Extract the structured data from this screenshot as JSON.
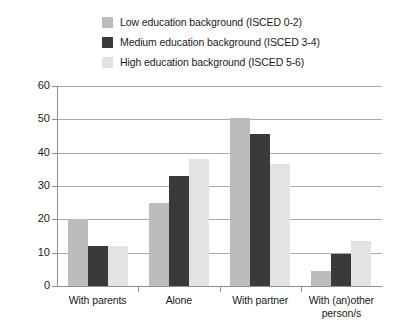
{
  "chart_data": {
    "type": "bar",
    "title": "",
    "xlabel": "",
    "ylabel": "",
    "ylim": [
      0,
      60
    ],
    "ytick_step": 10,
    "grid": true,
    "legend_position": "top",
    "categories": [
      "With parents",
      "Alone",
      "With partner",
      "With (an)other person/s"
    ],
    "category_lines": [
      [
        "With parents"
      ],
      [
        "Alone"
      ],
      [
        "With partner"
      ],
      [
        "With (an)other",
        "person/s"
      ]
    ],
    "yticks": [
      "0",
      "10",
      "20",
      "30",
      "40",
      "50",
      "60"
    ],
    "series": [
      {
        "name": "Low education background (ISCED 0-2)",
        "color": "#bcbcbc",
        "values": [
          20,
          25,
          50.5,
          4.5
        ]
      },
      {
        "name": "Medium education background (ISCED 3-4)",
        "color": "#3a3a3a",
        "values": [
          12,
          33,
          45.5,
          9.5
        ]
      },
      {
        "name": "High education background (ISCED 5-6)",
        "color": "#e3e3e3",
        "values": [
          12,
          38,
          36.5,
          13.5
        ]
      }
    ]
  }
}
